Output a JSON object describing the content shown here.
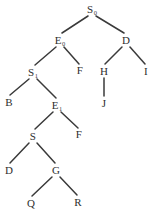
{
  "figure": {
    "type": "parse-tree",
    "background_color": "#ffffff",
    "stroke_color": "#3a3a3a",
    "text_color": "#2e2e2e",
    "width": 152,
    "height": 215
  },
  "nodes": [
    {
      "id": "n0",
      "label": "S",
      "subscript": "0",
      "x": 92,
      "y": 9,
      "name": "node-s0"
    },
    {
      "id": "n1",
      "label": "E",
      "subscript": "0",
      "x": 60,
      "y": 40,
      "name": "node-e0"
    },
    {
      "id": "n2",
      "label": "D",
      "subscript": "",
      "x": 126,
      "y": 40,
      "name": "node-d-right"
    },
    {
      "id": "n3",
      "label": "S",
      "subscript": "1",
      "x": 33,
      "y": 72,
      "name": "node-s1"
    },
    {
      "id": "n4",
      "label": "F",
      "subscript": "",
      "x": 80,
      "y": 70,
      "name": "node-f-upper"
    },
    {
      "id": "n5",
      "label": "H",
      "subscript": "",
      "x": 104,
      "y": 71,
      "name": "node-h"
    },
    {
      "id": "n6",
      "label": "I",
      "subscript": "",
      "x": 146,
      "y": 71,
      "name": "node-i"
    },
    {
      "id": "n7",
      "label": "B",
      "subscript": "",
      "x": 9,
      "y": 102,
      "name": "node-b"
    },
    {
      "id": "n8",
      "label": "E",
      "subscript": "1",
      "x": 57,
      "y": 105,
      "name": "node-e1"
    },
    {
      "id": "n9",
      "label": "J",
      "subscript": "",
      "x": 104,
      "y": 103,
      "name": "node-j"
    },
    {
      "id": "n10",
      "label": "S",
      "subscript": "",
      "x": 33,
      "y": 136,
      "name": "node-s-lower"
    },
    {
      "id": "n11",
      "label": "F",
      "subscript": "",
      "x": 79,
      "y": 134,
      "name": "node-f-lower"
    },
    {
      "id": "n12",
      "label": "D",
      "subscript": "",
      "x": 9,
      "y": 170,
      "name": "node-d-lower"
    },
    {
      "id": "n13",
      "label": "G",
      "subscript": "",
      "x": 56,
      "y": 170,
      "name": "node-g"
    },
    {
      "id": "n14",
      "label": "Q",
      "subscript": "",
      "x": 31,
      "y": 203,
      "name": "node-q"
    },
    {
      "id": "n15",
      "label": "R",
      "subscript": "",
      "x": 78,
      "y": 202,
      "name": "node-r"
    }
  ],
  "edges": [
    {
      "from": "n0",
      "to": "n1",
      "x1": 88,
      "y1": 16,
      "x2": 62,
      "y2": 33,
      "name": "edge-s0-e0"
    },
    {
      "from": "n0",
      "to": "n2",
      "x1": 96,
      "y1": 16,
      "x2": 124,
      "y2": 33,
      "name": "edge-s0-d"
    },
    {
      "from": "n1",
      "to": "n3",
      "x1": 56,
      "y1": 47,
      "x2": 35,
      "y2": 65,
      "name": "edge-e0-s1"
    },
    {
      "from": "n1",
      "to": "n4",
      "x1": 64,
      "y1": 47,
      "x2": 79,
      "y2": 64,
      "name": "edge-e0-f"
    },
    {
      "from": "n2",
      "to": "n5",
      "x1": 122,
      "y1": 47,
      "x2": 105,
      "y2": 64,
      "name": "edge-d-h"
    },
    {
      "from": "n2",
      "to": "n6",
      "x1": 130,
      "y1": 47,
      "x2": 145,
      "y2": 64,
      "name": "edge-d-i"
    },
    {
      "from": "n3",
      "to": "n7",
      "x1": 29,
      "y1": 79,
      "x2": 10,
      "y2": 95,
      "name": "edge-s1-b"
    },
    {
      "from": "n3",
      "to": "n8",
      "x1": 37,
      "y1": 79,
      "x2": 56,
      "y2": 98,
      "name": "edge-s1-e1"
    },
    {
      "from": "n5",
      "to": "n9",
      "x1": 104,
      "y1": 78,
      "x2": 104,
      "y2": 96,
      "name": "edge-h-j"
    },
    {
      "from": "n8",
      "to": "n10",
      "x1": 53,
      "y1": 112,
      "x2": 35,
      "y2": 129,
      "name": "edge-e1-s"
    },
    {
      "from": "n8",
      "to": "n11",
      "x1": 61,
      "y1": 112,
      "x2": 78,
      "y2": 128,
      "name": "edge-e1-f"
    },
    {
      "from": "n10",
      "to": "n12",
      "x1": 29,
      "y1": 143,
      "x2": 10,
      "y2": 163,
      "name": "edge-s-d"
    },
    {
      "from": "n10",
      "to": "n13",
      "x1": 37,
      "y1": 143,
      "x2": 55,
      "y2": 163,
      "name": "edge-s-g"
    },
    {
      "from": "n13",
      "to": "n14",
      "x1": 52,
      "y1": 177,
      "x2": 32,
      "y2": 196,
      "name": "edge-g-q"
    },
    {
      "from": "n13",
      "to": "n15",
      "x1": 60,
      "y1": 177,
      "x2": 77,
      "y2": 195,
      "name": "edge-g-r"
    }
  ]
}
